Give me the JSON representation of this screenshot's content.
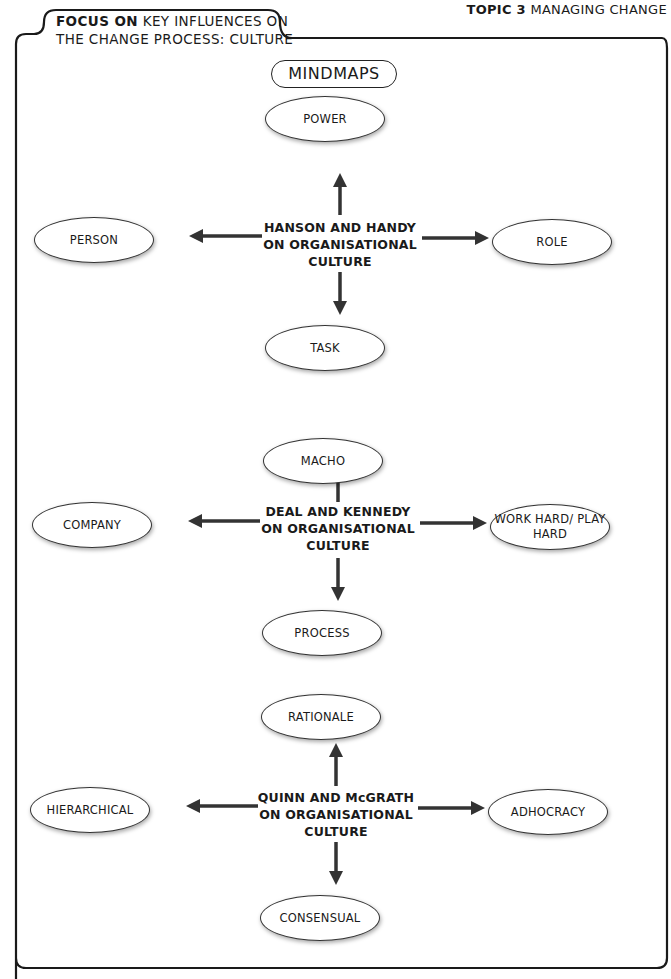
{
  "header": {
    "topic_bold": "TOPIC 3",
    "topic_rest": " MANAGING CHANGE",
    "focus_bold": "FOCUS ON",
    "focus_line1_rest": " KEY INFLUENCES ON",
    "focus_line2": "THE CHANGE PROCESS: CULTURE"
  },
  "title": "MINDMAPS",
  "mindmaps": [
    {
      "center": [
        "HANSON AND HANDY",
        "ON ORGANISATIONAL",
        "CULTURE"
      ],
      "top": "POWER",
      "left": "PERSON",
      "right": "ROLE",
      "bottom": "TASK"
    },
    {
      "center": [
        "DEAL AND KENNEDY",
        "ON ORGANISATIONAL",
        "CULTURE"
      ],
      "top": "MACHO",
      "left": "COMPANY",
      "right": "WORK HARD/ PLAY HARD",
      "bottom": "PROCESS"
    },
    {
      "center": [
        "QUINN AND McGRATH",
        "ON ORGANISATIONAL",
        "CULTURE"
      ],
      "top": "RATIONALE",
      "left": "HIERARCHICAL",
      "right": "ADHOCRACY",
      "bottom": "CONSENSUAL"
    }
  ],
  "colors": {
    "arrow": "#333333",
    "border": "#1a1a1a"
  }
}
